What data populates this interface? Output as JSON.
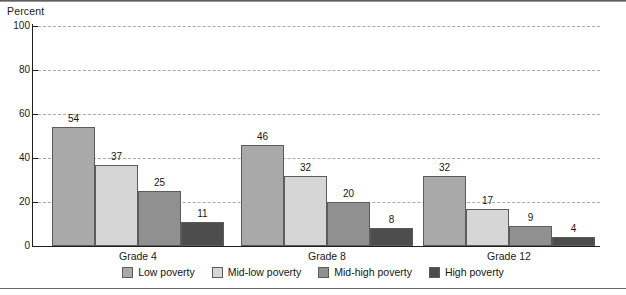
{
  "chart_data": {
    "type": "bar",
    "title": "",
    "xlabel": "",
    "ylabel": "Percent",
    "ylim": [
      0,
      100
    ],
    "yticks": [
      0,
      20,
      40,
      60,
      80,
      100
    ],
    "grid": true,
    "legend_position": "bottom",
    "categories": [
      "Grade 4",
      "Grade 8",
      "Grade 12"
    ],
    "series": [
      {
        "name": "Low poverty",
        "color": "#a9a9a9",
        "values": [
          54,
          46,
          32
        ]
      },
      {
        "name": "Mid-low poverty",
        "color": "#d6d6d6",
        "values": [
          37,
          32,
          17
        ]
      },
      {
        "name": "Mid-high poverty",
        "color": "#909090",
        "values": [
          25,
          20,
          9
        ]
      },
      {
        "name": "High poverty",
        "color": "#4d4d4d",
        "values": [
          11,
          8,
          4
        ]
      }
    ]
  },
  "axis": {
    "y_title": "Percent",
    "y_tick_labels": [
      "100",
      "80",
      "60",
      "40",
      "20",
      "0"
    ]
  },
  "bar_labels": {
    "grade4": [
      "54",
      "37",
      "25",
      "11"
    ],
    "grade8": [
      "46",
      "32",
      "20",
      "8"
    ],
    "grade12": [
      "32",
      "17",
      "9",
      "4"
    ]
  },
  "group_labels": [
    "Grade 4",
    "Grade 8",
    "Grade 12"
  ],
  "legend": {
    "items": [
      {
        "label": "Low poverty",
        "color": "#a9a9a9"
      },
      {
        "label": "Mid-low poverty",
        "color": "#d6d6d6"
      },
      {
        "label": "Mid-high poverty",
        "color": "#909090"
      },
      {
        "label": "High poverty",
        "color": "#4d4d4d"
      }
    ]
  }
}
